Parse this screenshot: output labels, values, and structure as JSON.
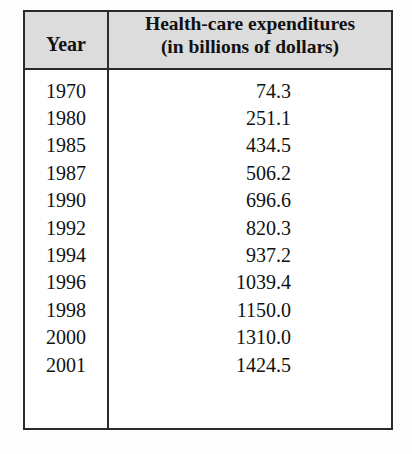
{
  "table": {
    "headers": {
      "year": "Year",
      "expenditures_line1": "Health-care expenditures",
      "expenditures_line2": "(in billions of dollars)"
    },
    "rows": [
      {
        "year": "1970",
        "value": "74.3"
      },
      {
        "year": "1980",
        "value": "251.1"
      },
      {
        "year": "1985",
        "value": "434.5"
      },
      {
        "year": "1987",
        "value": "506.2"
      },
      {
        "year": "1990",
        "value": "696.6"
      },
      {
        "year": "1992",
        "value": "820.3"
      },
      {
        "year": "1994",
        "value": "937.2"
      },
      {
        "year": "1996",
        "value": "1039.4"
      },
      {
        "year": "1998",
        "value": "1150.0"
      },
      {
        "year": "2000",
        "value": "1310.0"
      },
      {
        "year": "2001",
        "value": "1424.5"
      }
    ]
  },
  "chart_data": {
    "type": "table",
    "title": "Health-care expenditures (in billions of dollars)",
    "columns": [
      "Year",
      "Health-care expenditures (in billions of dollars)"
    ],
    "x": [
      1970,
      1980,
      1985,
      1987,
      1990,
      1992,
      1994,
      1996,
      1998,
      2000,
      2001
    ],
    "values": [
      74.3,
      251.1,
      434.5,
      506.2,
      696.6,
      820.3,
      937.2,
      1039.4,
      1150.0,
      1310.0,
      1424.5
    ],
    "xlabel": "Year",
    "ylabel": "Health-care expenditures (in billions of dollars)",
    "grid": false,
    "legend": null
  },
  "colors": {
    "header_background": "#dcdcdc",
    "border": "#2b2b2b",
    "text": "#111111",
    "page_background": "#fdfdfd"
  }
}
